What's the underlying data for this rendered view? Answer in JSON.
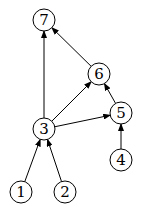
{
  "diagram": {
    "type": "directed-graph",
    "nodes": [
      {
        "id": "1",
        "label": "1",
        "x": 21,
        "y": 192
      },
      {
        "id": "2",
        "label": "2",
        "x": 65,
        "y": 192
      },
      {
        "id": "3",
        "label": "3",
        "x": 44,
        "y": 129
      },
      {
        "id": "4",
        "label": "4",
        "x": 121,
        "y": 160
      },
      {
        "id": "5",
        "label": "5",
        "x": 121,
        "y": 113
      },
      {
        "id": "6",
        "label": "6",
        "x": 99,
        "y": 74
      },
      {
        "id": "7",
        "label": "7",
        "x": 44,
        "y": 20
      }
    ],
    "edges": [
      {
        "from": "3",
        "to": "7"
      },
      {
        "from": "6",
        "to": "7"
      },
      {
        "from": "3",
        "to": "6"
      },
      {
        "from": "3",
        "to": "5"
      },
      {
        "from": "5",
        "to": "6"
      },
      {
        "from": "4",
        "to": "5"
      },
      {
        "from": "1",
        "to": "3"
      },
      {
        "from": "2",
        "to": "3"
      }
    ],
    "node_radius": 11,
    "stroke_color": "#000000"
  }
}
